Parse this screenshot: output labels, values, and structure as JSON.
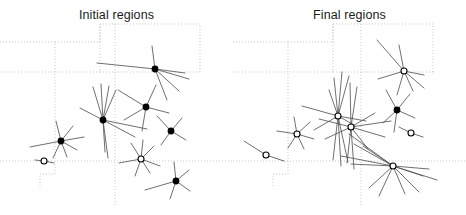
{
  "figure": {
    "background": "#ffffff",
    "width": 466,
    "height": 215,
    "marker_filled_color": "#000000",
    "marker_open_color": "#000000",
    "ray_color": "#555555",
    "region_boundary_color": "#b9b9b9"
  },
  "panels": [
    {
      "id": "initial",
      "title": "Initial regions"
    },
    {
      "id": "final",
      "title": "Final regions"
    }
  ],
  "chart_data": {
    "type": "scatter",
    "subtitle": "",
    "xlabel": "",
    "ylabel": "",
    "grid": false,
    "legend": "none",
    "xlim": [
      0,
      233
    ],
    "ylim": [
      0,
      215
    ],
    "series": [
      {
        "name": "Initial regions",
        "panel": "initial",
        "points": [
          {
            "x": 155,
            "y": 69,
            "marker": "filled",
            "rays": [
              [
                -3,
                -23
              ],
              [
                -58,
                -6
              ],
              [
                34,
                10
              ],
              [
                24,
                22
              ],
              [
                12,
                31
              ],
              [
                30,
                4
              ]
            ]
          },
          {
            "x": 103,
            "y": 120,
            "marker": "filled",
            "rays": [
              [
                -10,
                -33
              ],
              [
                -2,
                -36
              ],
              [
                6,
                -34
              ],
              [
                13,
                -30
              ],
              [
                -23,
                -12
              ],
              [
                44,
                9
              ],
              [
                32,
                17
              ],
              [
                5,
                38
              ],
              [
                2,
                32
              ]
            ]
          },
          {
            "x": 146,
            "y": 107,
            "marker": "filled",
            "rays": [
              [
                -28,
                -17
              ],
              [
                10,
                -22
              ],
              [
                23,
                6
              ],
              [
                -22,
                13
              ],
              [
                -4,
                24
              ]
            ]
          },
          {
            "x": 61,
            "y": 141,
            "marker": "filled",
            "rays": [
              [
                -5,
                -20
              ],
              [
                12,
                -15
              ],
              [
                -31,
                6
              ],
              [
                23,
                -4
              ],
              [
                16,
                9
              ],
              [
                -8,
                17
              ],
              [
                6,
                16
              ]
            ]
          },
          {
            "x": 171,
            "y": 131,
            "marker": "filled",
            "rays": [
              [
                -14,
                -15
              ],
              [
                11,
                -13
              ],
              [
                15,
                9
              ],
              [
                -10,
                14
              ]
            ]
          },
          {
            "x": 176,
            "y": 181,
            "marker": "filled",
            "rays": [
              [
                -2,
                -19
              ],
              [
                13,
                -11
              ],
              [
                -31,
                9
              ],
              [
                14,
                10
              ],
              [
                -6,
                18
              ]
            ]
          },
          {
            "x": 141,
            "y": 159,
            "marker": "open",
            "rays": [
              [
                -10,
                -16
              ],
              [
                2,
                -19
              ],
              [
                13,
                -13
              ],
              [
                -22,
                4
              ],
              [
                19,
                7
              ],
              [
                -6,
                17
              ],
              [
                9,
                14
              ]
            ]
          },
          {
            "x": 44,
            "y": 161,
            "marker": "open",
            "rays": [
              [
                -9,
                -1
              ],
              [
                10,
                2
              ]
            ]
          }
        ]
      },
      {
        "name": "Final regions",
        "panel": "final",
        "points": [
          {
            "x": 171,
            "y": 71,
            "marker": "open",
            "rays": [
              [
                -5,
                -26
              ],
              [
                -27,
                -31
              ],
              [
                -26,
                8
              ],
              [
                20,
                4
              ],
              [
                9,
                20
              ],
              [
                20,
                17
              ],
              [
                -7,
                24
              ]
            ]
          },
          {
            "x": 105,
            "y": 116,
            "marker": "open",
            "rays": [
              [
                -4,
                -38
              ],
              [
                4,
                -44
              ],
              [
                11,
                -40
              ],
              [
                -9,
                -26
              ],
              [
                -36,
                -10
              ],
              [
                -24,
                14
              ],
              [
                16,
                9
              ],
              [
                10,
                46
              ],
              [
                3,
                50
              ],
              [
                -5,
                44
              ],
              [
                28,
                5
              ]
            ]
          },
          {
            "x": 118,
            "y": 127,
            "marker": "open",
            "rays": [
              [
                -1,
                -44
              ],
              [
                6,
                -40
              ],
              [
                -32,
                -8
              ],
              [
                -26,
                12
              ],
              [
                40,
                -6
              ],
              [
                34,
                10
              ],
              [
                17,
                22
              ],
              [
                -4,
                36
              ],
              [
                3,
                42
              ],
              [
                24,
                -14
              ]
            ]
          },
          {
            "x": 164,
            "y": 110,
            "marker": "filled",
            "rays": [
              [
                -11,
                -20
              ],
              [
                13,
                -16
              ],
              [
                18,
                8
              ],
              [
                -14,
                13
              ],
              [
                -3,
                22
              ]
            ]
          },
          {
            "x": 64,
            "y": 134,
            "marker": "open",
            "rays": [
              [
                -3,
                -17
              ],
              [
                13,
                -12
              ],
              [
                -20,
                -3
              ],
              [
                17,
                5
              ],
              [
                -9,
                14
              ],
              [
                7,
                15
              ]
            ]
          },
          {
            "x": 33,
            "y": 155,
            "marker": "open",
            "rays": [
              [
                -22,
                -14
              ],
              [
                18,
                6
              ]
            ]
          },
          {
            "x": 178,
            "y": 133,
            "marker": "open",
            "rays": [
              [
                -12,
                -6
              ],
              [
                12,
                4
              ]
            ]
          },
          {
            "x": 160,
            "y": 166,
            "marker": "open",
            "rays": [
              [
                -44,
                -32
              ],
              [
                -39,
                -22
              ],
              [
                -52,
                -10
              ],
              [
                -42,
                -2
              ],
              [
                -30,
                -20
              ],
              [
                36,
                3
              ],
              [
                30,
                10
              ],
              [
                44,
                14
              ],
              [
                -14,
                30
              ],
              [
                12,
                28
              ],
              [
                26,
                26
              ],
              [
                -24,
                22
              ]
            ]
          }
        ]
      }
    ],
    "region_boundaries": {
      "initial": [
        [
          [
            0,
            42
          ],
          [
            55,
            42
          ],
          [
            55,
            174
          ],
          [
            40,
            174
          ],
          [
            40,
            186
          ]
        ],
        [
          [
            55,
            42
          ],
          [
            100,
            42
          ],
          [
            100,
            24
          ]
        ],
        [
          [
            100,
            24
          ],
          [
            100,
            72
          ],
          [
            200,
            72
          ]
        ],
        [
          [
            100,
            72
          ],
          [
            0,
            72
          ]
        ],
        [
          [
            200,
            72
          ],
          [
            200,
            24
          ]
        ],
        [
          [
            200,
            24
          ],
          [
            100,
            24
          ]
        ],
        [
          [
            0,
            161
          ],
          [
            233,
            161
          ]
        ],
        [
          [
            115,
            24
          ],
          [
            115,
            205
          ]
        ]
      ],
      "final": [
        [
          [
            0,
            42
          ],
          [
            55,
            42
          ],
          [
            55,
            174
          ],
          [
            40,
            174
          ],
          [
            40,
            186
          ]
        ],
        [
          [
            55,
            42
          ],
          [
            100,
            42
          ],
          [
            100,
            24
          ]
        ],
        [
          [
            100,
            24
          ],
          [
            100,
            72
          ],
          [
            200,
            72
          ]
        ],
        [
          [
            100,
            72
          ],
          [
            0,
            72
          ]
        ],
        [
          [
            200,
            72
          ],
          [
            200,
            24
          ]
        ],
        [
          [
            200,
            24
          ],
          [
            100,
            24
          ]
        ],
        [
          [
            0,
            161
          ],
          [
            233,
            161
          ]
        ],
        [
          [
            128,
            24
          ],
          [
            128,
            205
          ]
        ]
      ]
    }
  }
}
